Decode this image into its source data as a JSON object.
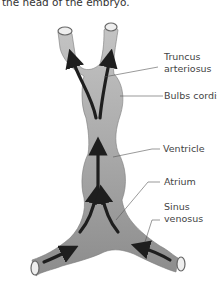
{
  "caption": "the head of the embryo.",
  "diagram": {
    "labels": [
      {
        "id": "truncus-arteriosus",
        "line1": "Truncus",
        "line2": "arteriosus"
      },
      {
        "id": "bulbs-cordis",
        "line1": "Bulbs cordis",
        "line2": ""
      },
      {
        "id": "ventricle",
        "line1": "Ventricle",
        "line2": ""
      },
      {
        "id": "atrium",
        "line1": "Atrium",
        "line2": ""
      },
      {
        "id": "sinus-venosus",
        "line1": "Sinus",
        "line2": "venosus"
      }
    ],
    "colors": {
      "tissue": "#b5b5b5",
      "tissue_dark": "#8f8f8f",
      "arrow": "#1e1e1e",
      "leader": "#555555"
    }
  }
}
